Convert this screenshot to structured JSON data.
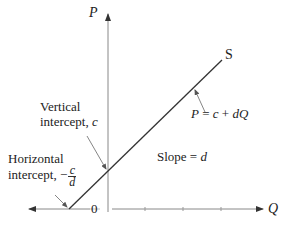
{
  "diagram": {
    "axes": {
      "y_label": "P",
      "x_label": "Q",
      "origin_label": "0"
    },
    "curve": {
      "label": "S",
      "equation": {
        "lhs": "P",
        "eq": " = ",
        "c": "c",
        "plus": " + ",
        "dq": "dQ"
      }
    },
    "annotations": {
      "vertical_intercept": {
        "line1": "Vertical",
        "line2_text": "intercept, ",
        "line2_var": "c"
      },
      "horizontal_intercept": {
        "line1": "Horizontal",
        "line2_text": "intercept, −",
        "frac_num": "c",
        "frac_den": "d"
      },
      "slope": {
        "text": "Slope = ",
        "var": "d"
      }
    },
    "colors": {
      "axis": "#888888",
      "line": "#333333",
      "text": "#222222"
    }
  }
}
